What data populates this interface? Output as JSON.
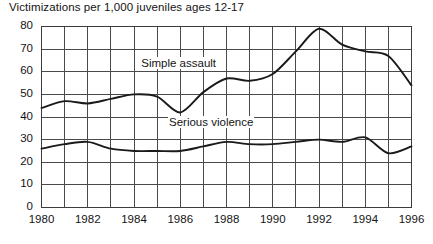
{
  "chart_data": {
    "type": "line",
    "title": "Victimizations per 1,000 juveniles ages 12-17",
    "xlabel": "",
    "ylabel": "",
    "xlim": [
      1980,
      1996
    ],
    "ylim": [
      0,
      80
    ],
    "ytick_step": 10,
    "xtick_step": 1,
    "xlabel_step": 2,
    "grid": true,
    "legend_position": "inline-annotation",
    "x": [
      1980,
      1981,
      1982,
      1983,
      1984,
      1985,
      1986,
      1987,
      1988,
      1989,
      1990,
      1991,
      1992,
      1993,
      1994,
      1995,
      1996
    ],
    "yticks": [
      0,
      10,
      20,
      30,
      40,
      50,
      60,
      70,
      80
    ],
    "xticks": [
      1980,
      1981,
      1982,
      1983,
      1984,
      1985,
      1986,
      1987,
      1988,
      1989,
      1990,
      1991,
      1992,
      1993,
      1994,
      1995,
      1996
    ],
    "xtick_labels": [
      "1980",
      "",
      "1982",
      "",
      "1984",
      "",
      "1986",
      "",
      "1988",
      "",
      "1990",
      "",
      "1992",
      "",
      "1994",
      "",
      "1996"
    ],
    "series": [
      {
        "name": "Simple assault",
        "color": "#1a1a1a",
        "label_x": 1986.0,
        "label_y": 63,
        "values": [
          44,
          47,
          46,
          48,
          50,
          49,
          42,
          51,
          57,
          56,
          59,
          69,
          79,
          72,
          69,
          67,
          54
        ]
      },
      {
        "name": "Serious violence",
        "color": "#1a1a1a",
        "label_x": 1987.2,
        "label_y": 37,
        "values": [
          26,
          28,
          29,
          26,
          25,
          25,
          25,
          27,
          29,
          28,
          28,
          29,
          30,
          29,
          31,
          24,
          27
        ]
      }
    ],
    "annotations": [
      {
        "text": "Simple assault",
        "x": 1986.0,
        "y": 63
      },
      {
        "text": "Serious violence",
        "x": 1987.2,
        "y": 37
      }
    ]
  },
  "colors": {
    "background": "#ffffff",
    "axis": "#3c3c3c",
    "grid": "#4a4a4a",
    "line": "#1a1a1a",
    "text": "#141414"
  }
}
